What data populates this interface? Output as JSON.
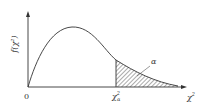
{
  "diagram": {
    "y_axis_label": "f(χ²)",
    "x_axis_label": "χ²",
    "origin_label": "0",
    "critical_label_base": "χ",
    "critical_label_sup": "2",
    "critical_label_sub": "α",
    "area_label": "α",
    "colors": {
      "line": "#333333",
      "hatch": "#444444",
      "background": "#ffffff"
    }
  }
}
